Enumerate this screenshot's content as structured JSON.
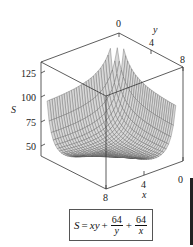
{
  "chart_data": {
    "type": "surface3d",
    "title": "",
    "function": "S = xy + 64/y + 64/x",
    "x_axis": {
      "label": "x",
      "ticks": [
        "8",
        "4",
        "0"
      ],
      "range": [
        0,
        8
      ]
    },
    "y_axis": {
      "label": "y",
      "ticks": [
        "0",
        "4",
        "8"
      ],
      "range": [
        0,
        8
      ]
    },
    "z_axis": {
      "label": "S",
      "ticks": [
        "50",
        "75",
        "100",
        "125"
      ],
      "range": [
        40,
        136
      ]
    },
    "grid_lines": 30,
    "surface_color": "#555555",
    "legend": null
  },
  "formula": {
    "lhs": "S",
    "eq": "=",
    "term1": "xy",
    "plus": "+",
    "frac1_num": "64",
    "frac1_den": "y",
    "frac2_num": "64",
    "frac2_den": "x"
  },
  "labels": {
    "z_label": "S",
    "y_label": "y",
    "x_label": "x",
    "z_ticks": [
      "125",
      "100",
      "75",
      "50"
    ],
    "y_ticks": [
      "0",
      "4",
      "8"
    ],
    "x_ticks": [
      "0",
      "4",
      "8"
    ]
  }
}
